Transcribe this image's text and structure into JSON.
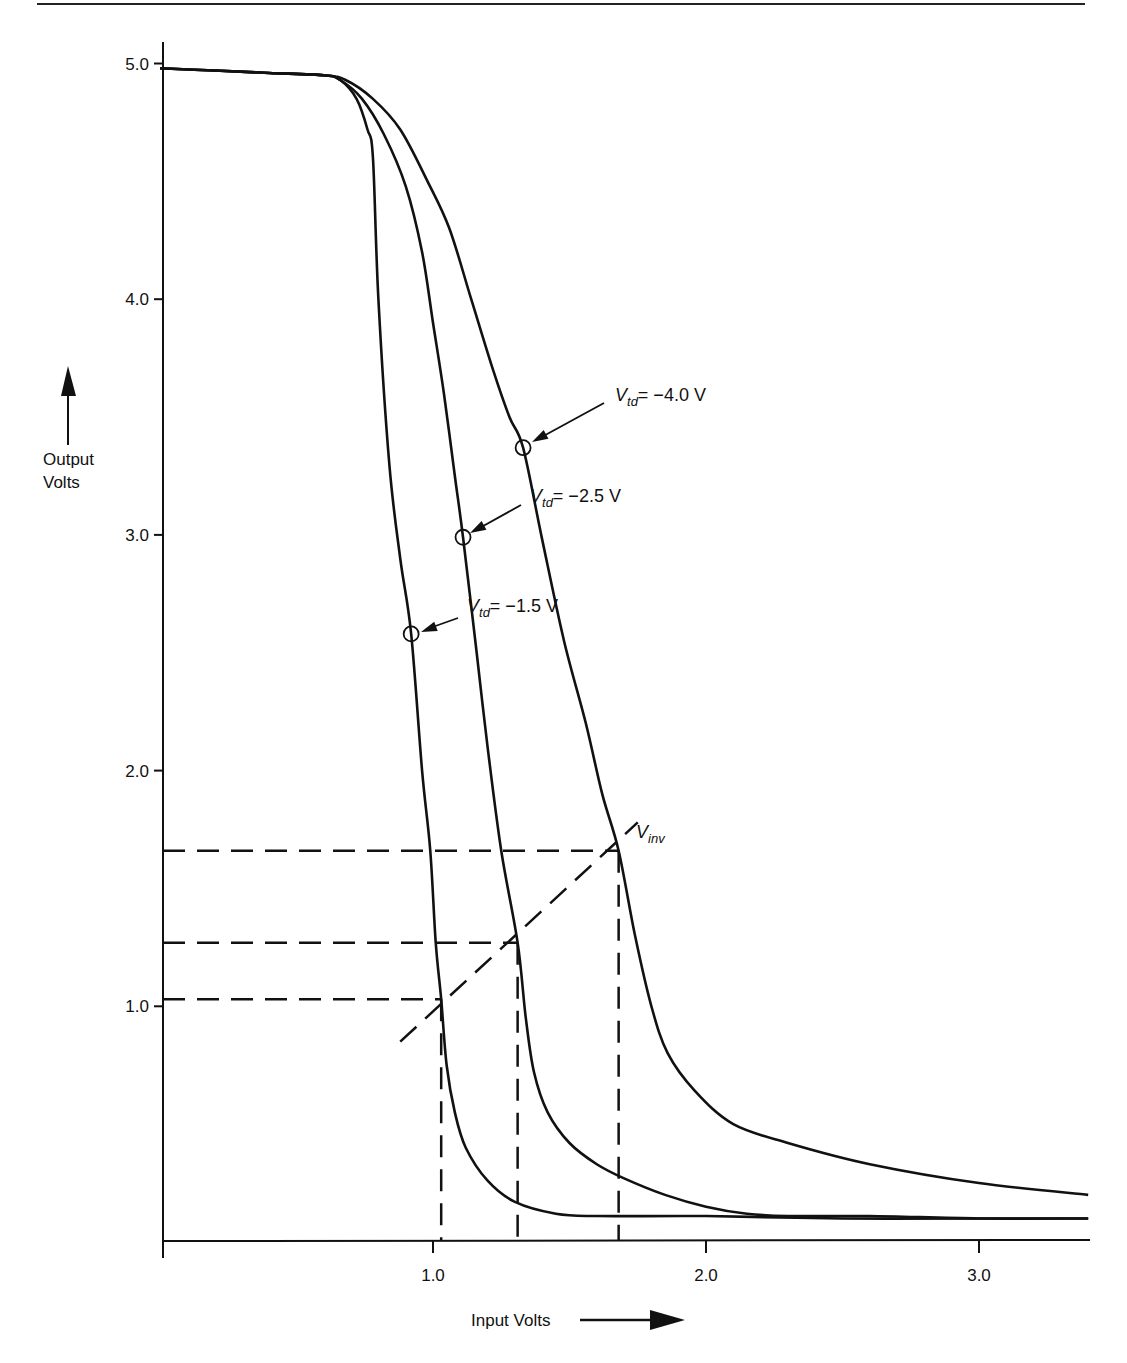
{
  "page": {
    "top_rule": true
  },
  "chart_data": {
    "type": "line",
    "title": "",
    "xlabel": "Input Volts",
    "ylabel": "Output Volts",
    "xlim": [
      0,
      3.4
    ],
    "ylim": [
      0,
      5.0
    ],
    "grid": false,
    "legend": "none (curves labeled with callouts)",
    "x_ticks": [
      1.0,
      2.0,
      3.0
    ],
    "x_tick_labels": [
      "1.0",
      "2.0",
      "3.0"
    ],
    "y_ticks": [
      1.0,
      2.0,
      3.0,
      4.0,
      5.0
    ],
    "y_tick_labels": [
      "1.0",
      "2.0",
      "3.0",
      "4.0",
      "5.0"
    ],
    "series": [
      {
        "name": "Vtd = -1.5 V",
        "label_main": "V",
        "label_sub": "td",
        "label_value": "= −1.5 V",
        "marker_point": [
          0.92,
          2.58
        ],
        "points": [
          [
            0.0,
            4.98
          ],
          [
            0.2,
            4.97
          ],
          [
            0.4,
            4.96
          ],
          [
            0.6,
            4.95
          ],
          [
            0.66,
            4.93
          ],
          [
            0.72,
            4.85
          ],
          [
            0.76,
            4.72
          ],
          [
            0.78,
            4.6
          ],
          [
            0.8,
            4.0
          ],
          [
            0.84,
            3.3
          ],
          [
            0.88,
            2.9
          ],
          [
            0.92,
            2.58
          ],
          [
            0.96,
            2.0
          ],
          [
            0.99,
            1.66
          ],
          [
            1.01,
            1.27
          ],
          [
            1.03,
            1.03
          ],
          [
            1.05,
            0.75
          ],
          [
            1.08,
            0.55
          ],
          [
            1.12,
            0.4
          ],
          [
            1.2,
            0.26
          ],
          [
            1.3,
            0.17
          ],
          [
            1.45,
            0.12
          ],
          [
            1.6,
            0.11
          ],
          [
            2.0,
            0.11
          ],
          [
            2.5,
            0.1
          ],
          [
            3.0,
            0.1
          ],
          [
            3.4,
            0.1
          ]
        ]
      },
      {
        "name": "Vtd = -2.5 V",
        "label_main": "V",
        "label_sub": "td",
        "label_value": "= −2.5 V",
        "marker_point": [
          1.11,
          2.99
        ],
        "points": [
          [
            0.0,
            4.98
          ],
          [
            0.2,
            4.97
          ],
          [
            0.4,
            4.96
          ],
          [
            0.6,
            4.95
          ],
          [
            0.66,
            4.93
          ],
          [
            0.74,
            4.85
          ],
          [
            0.82,
            4.7
          ],
          [
            0.9,
            4.48
          ],
          [
            0.96,
            4.2
          ],
          [
            1.0,
            3.9
          ],
          [
            1.04,
            3.6
          ],
          [
            1.08,
            3.25
          ],
          [
            1.11,
            2.99
          ],
          [
            1.16,
            2.5
          ],
          [
            1.2,
            2.1
          ],
          [
            1.25,
            1.66
          ],
          [
            1.31,
            1.27
          ],
          [
            1.34,
            0.95
          ],
          [
            1.37,
            0.72
          ],
          [
            1.42,
            0.55
          ],
          [
            1.5,
            0.42
          ],
          [
            1.6,
            0.33
          ],
          [
            1.7,
            0.27
          ],
          [
            1.85,
            0.2
          ],
          [
            2.0,
            0.15
          ],
          [
            2.15,
            0.12
          ],
          [
            2.3,
            0.11
          ],
          [
            2.6,
            0.11
          ],
          [
            3.0,
            0.1
          ],
          [
            3.4,
            0.1
          ]
        ]
      },
      {
        "name": "Vtd = -4.0 V",
        "label_main": "V",
        "label_sub": "td",
        "label_value": "= −4.0 V",
        "marker_point": [
          1.33,
          3.37
        ],
        "points": [
          [
            0.0,
            4.98
          ],
          [
            0.2,
            4.97
          ],
          [
            0.4,
            4.96
          ],
          [
            0.6,
            4.95
          ],
          [
            0.68,
            4.93
          ],
          [
            0.78,
            4.85
          ],
          [
            0.88,
            4.72
          ],
          [
            0.98,
            4.5
          ],
          [
            1.06,
            4.3
          ],
          [
            1.14,
            4.0
          ],
          [
            1.22,
            3.7
          ],
          [
            1.28,
            3.5
          ],
          [
            1.33,
            3.37
          ],
          [
            1.4,
            2.98
          ],
          [
            1.48,
            2.55
          ],
          [
            1.56,
            2.2
          ],
          [
            1.62,
            1.9
          ],
          [
            1.68,
            1.66
          ],
          [
            1.74,
            1.3
          ],
          [
            1.8,
            1.0
          ],
          [
            1.86,
            0.8
          ],
          [
            1.96,
            0.64
          ],
          [
            2.1,
            0.5
          ],
          [
            2.3,
            0.42
          ],
          [
            2.6,
            0.33
          ],
          [
            3.0,
            0.25
          ],
          [
            3.4,
            0.2
          ]
        ]
      }
    ],
    "annotations": {
      "vinv_label_main": "V",
      "vinv_label_sub": "inv",
      "vinv_line": [
        [
          0.88,
          0.85
        ],
        [
          1.75,
          1.78
        ]
      ],
      "vinv_points": [
        {
          "series": "Vtd = -1.5 V",
          "x": 1.03,
          "y": 1.03
        },
        {
          "series": "Vtd = -2.5 V",
          "x": 1.31,
          "y": 1.27
        },
        {
          "series": "Vtd = -4.0 V",
          "x": 1.68,
          "y": 1.66
        }
      ],
      "dashed_guides": "horizontal dashed lines from y-axis to each Vinv point; vertical dashed lines from each Vinv point down to x-axis"
    }
  },
  "axes": {
    "x_title": "Input Volts",
    "y_title_line1": "Output",
    "y_title_line2": "Volts"
  }
}
